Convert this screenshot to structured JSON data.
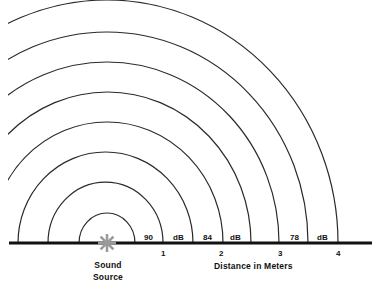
{
  "diagram": {
    "source_label_line1": "Sound",
    "source_label_line2": "Source",
    "axis_label": "Distance in Meters",
    "source_icon": "starburst-icon",
    "colors": {
      "lines": "#222222",
      "baseline": "#111111",
      "source": "#9a9a9a"
    },
    "ticks": [
      "1",
      "2",
      "3",
      "4"
    ],
    "level_labels": [
      {
        "value": "90",
        "unit": "dB"
      },
      {
        "value": "84",
        "unit": "dB"
      },
      {
        "value": "78",
        "unit": "dB"
      }
    ],
    "wave_count": 8
  }
}
